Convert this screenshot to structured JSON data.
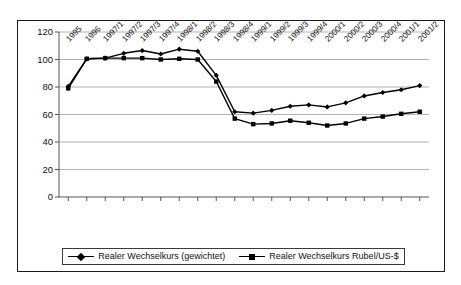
{
  "chart_data": {
    "type": "line",
    "title": "",
    "xlabel": "",
    "ylabel": "",
    "ylim": [
      0,
      120
    ],
    "ytick_step": 20,
    "yticks": [
      "120",
      "100",
      "80",
      "60",
      "40",
      "20",
      "0"
    ],
    "grid": "horizontal",
    "legend_position": "bottom",
    "categories": [
      "1995",
      "1996",
      "1997/1",
      "1997/2",
      "1997/3",
      "1997/4",
      "1998/1",
      "1998/2",
      "1998/3",
      "1998/4",
      "1999/1",
      "1999/2",
      "1999/3",
      "1999/4",
      "2000/1",
      "2000/2",
      "2000/3",
      "2000/4",
      "2001/1",
      "2001/2"
    ],
    "series": [
      {
        "name": "Realer Wechselkurs (gewichtet)",
        "marker": "diamond",
        "color": "#000000",
        "values": [
          80.5,
          100.5,
          101,
          104.5,
          106.5,
          104,
          107.5,
          106,
          88.5,
          62,
          61,
          63,
          66,
          67,
          65.5,
          68.5,
          73.5,
          76,
          78,
          81
        ]
      },
      {
        "name": "Realer Wechselkurs Rubel/US-$",
        "marker": "square",
        "color": "#000000",
        "values": [
          79,
          100.5,
          101,
          101,
          101,
          100,
          100.5,
          100,
          84,
          57,
          53,
          53.5,
          55.5,
          54,
          52,
          53.5,
          57,
          58.5,
          60.5,
          62
        ]
      }
    ]
  },
  "legend": {
    "entries": [
      {
        "label": "Realer Wechselkurs (gewichtet)"
      },
      {
        "label": "Realer Wechselkurs Rubel/US-$"
      }
    ]
  },
  "colors": {
    "frame": "#1c1c1c",
    "grid": "#a0a0a0",
    "axis": "#555555",
    "series": "#000000",
    "background": "#ffffff"
  }
}
